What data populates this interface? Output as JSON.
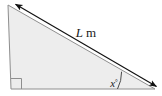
{
  "figure": {
    "name": "right-triangle-with-hypotenuse-dimension",
    "type": "geometry-diagram",
    "canvas": {
      "width": 162,
      "height": 96,
      "background": "#ffffff"
    },
    "shape": {
      "kind": "right-triangle",
      "fill_color": "#ededed",
      "stroke_color": "#8e8e8e",
      "stroke_width": 1,
      "vertices": {
        "apex_top_left": {
          "x": 8,
          "y": 5
        },
        "right_angle_bottom_left": {
          "x": 11,
          "y": 89
        },
        "acute_bottom_right": {
          "x": 155,
          "y": 89
        }
      }
    },
    "right_angle_marker": {
      "name": "right-angle-marker",
      "vertex": {
        "x": 11,
        "y": 89
      },
      "size": 11,
      "stroke_color": "#8e8e8e"
    },
    "angle_arc": {
      "name": "angle-arc",
      "vertex": {
        "x": 155,
        "y": 89
      },
      "radius": 38,
      "stroke_color": "#4a4a4a"
    },
    "dimension_arrow": {
      "name": "hypotenuse-dimension-arrow",
      "style": "double-headed",
      "stroke_color": "#111111",
      "stroke_width": 1.1,
      "start": {
        "x": 14,
        "y": 4
      },
      "end": {
        "x": 158,
        "y": 88
      }
    }
  },
  "labels": {
    "hypotenuse": {
      "symbol": "L",
      "unit": "m",
      "full_text": "L m",
      "x": 86,
      "y": 37,
      "font_size": 13
    },
    "angle": {
      "symbol": "x",
      "degree_sign": "°",
      "full_text": "x°",
      "x": 116,
      "y": 86,
      "font_size": 11
    }
  }
}
